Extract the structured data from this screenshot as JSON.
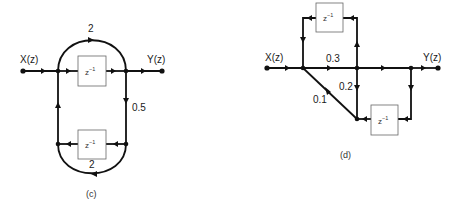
{
  "diagrams": [
    {
      "id": "c",
      "caption": "(c)",
      "input_label": "X(z)",
      "output_label": "Y(z)",
      "gains": {
        "top_arc": "2",
        "right_branch": "0.5",
        "bottom_arc": "2"
      },
      "delay_blocks": [
        {
          "label": "z",
          "exp": "−1"
        },
        {
          "label": "z",
          "exp": "−1"
        }
      ]
    },
    {
      "id": "d",
      "caption": "(d)",
      "input_label": "X(z)",
      "output_label": "Y(z)",
      "gains": {
        "forward": "0.3",
        "down": "0.2",
        "diagonal": "0.1"
      },
      "delay_blocks": [
        {
          "label": "z",
          "exp": "−1"
        },
        {
          "label": "z",
          "exp": "−1"
        }
      ]
    }
  ]
}
